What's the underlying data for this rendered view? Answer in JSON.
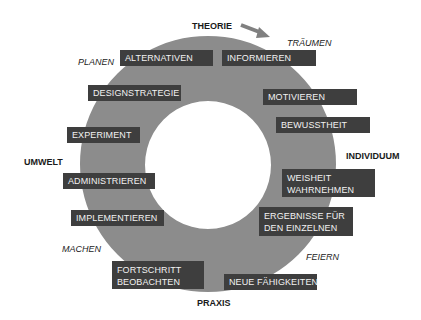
{
  "axes": {
    "top": "THEORIE",
    "bottom": "PRAXIS",
    "left": "UMWELT",
    "right": "INDIVIDUUM"
  },
  "phases": {
    "traeumen": "TRÄUMEN",
    "planen": "PLANEN",
    "machen": "MACHEN",
    "feiern": "FEIERN"
  },
  "boxes": {
    "alternativen": "ALTERNATIVEN",
    "informieren": "INFORMIEREN",
    "designstrategie": "DESIGNSTRATEGIE",
    "motivieren": "MOTIVIEREN",
    "bewusstheit": "BEWUSSTHEIT",
    "experiment": "EXPERIMENT",
    "administrieren": "ADMINISTRIEREN",
    "implementieren": "IMPLEMENTIEREN",
    "weisheit_line1": "WEISHEIT",
    "weisheit_line2": "WAHRNEHMEN",
    "ergebnisse_line1": "ERGEBNISSE FÜR",
    "ergebnisse_line2": "DEN EINZELNEN",
    "fortschritt_line1": "FORTSCHRITT",
    "fortschritt_line2": "BEOBACHTEN",
    "neue_faehigkeiten": "NEUE FÄHIGKEITEN"
  },
  "colors": {
    "ring": "#8c8c8c",
    "box": "#3e3e3e",
    "box_text": "#f2f2f2",
    "arrow": "#808080"
  }
}
